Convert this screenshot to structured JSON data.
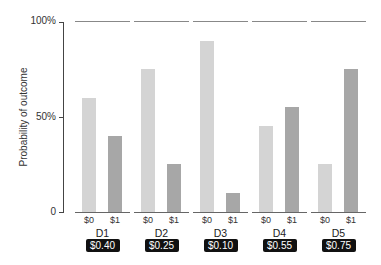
{
  "chart_data": {
    "type": "bar",
    "title": "",
    "xlabel": "",
    "ylabel": "Probability of outcome",
    "ylim": [
      0,
      100
    ],
    "yticks": [
      {
        "value": 0,
        "label": "0"
      },
      {
        "value": 50,
        "label": "50%"
      },
      {
        "value": 100,
        "label": "100%"
      }
    ],
    "grid": false,
    "categories": [
      "D1",
      "D2",
      "D3",
      "D4",
      "D5"
    ],
    "sub_categories": [
      "$0",
      "$1"
    ],
    "series": [
      {
        "name": "$0",
        "color": "#d4d4d4",
        "values": [
          60,
          75,
          90,
          45,
          25
        ]
      },
      {
        "name": "$1",
        "color": "#a7a7a7",
        "values": [
          40,
          25,
          10,
          55,
          75
        ]
      }
    ],
    "annotations": [
      "$0.40",
      "$0.25",
      "$0.10",
      "$0.55",
      "$0.75"
    ]
  },
  "panels": [
    {
      "label": "D1",
      "badge": "$0.40",
      "v0": 60,
      "v1": 40,
      "t0": "$0",
      "t1": "$1"
    },
    {
      "label": "D2",
      "badge": "$0.25",
      "v0": 75,
      "v1": 25,
      "t0": "$0",
      "t1": "$1"
    },
    {
      "label": "D3",
      "badge": "$0.10",
      "v0": 90,
      "v1": 10,
      "t0": "$0",
      "t1": "$1"
    },
    {
      "label": "D4",
      "badge": "$0.55",
      "v0": 45,
      "v1": 55,
      "t0": "$0",
      "t1": "$1"
    },
    {
      "label": "D5",
      "badge": "$0.75",
      "v0": 25,
      "v1": 75,
      "t0": "$0",
      "t1": "$1"
    }
  ],
  "axis": {
    "ylabel": "Probability of outcome",
    "tick_100": "100%",
    "tick_50": "50%",
    "tick_0": "0"
  }
}
